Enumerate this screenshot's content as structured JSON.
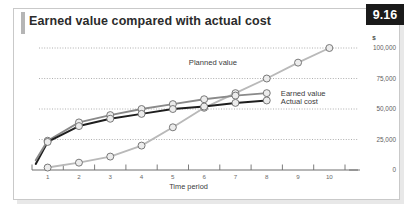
{
  "figure": {
    "badge": "9.16",
    "title": "Earned value compared with actual cost"
  },
  "chart_data": {
    "type": "line",
    "title": "Earned value compared with actual cost",
    "xlabel": "Time period",
    "ylabel": "$",
    "x": [
      1,
      2,
      3,
      4,
      5,
      6,
      7,
      8,
      9,
      10
    ],
    "xticklabels": [
      "1",
      "2",
      "3",
      "4",
      "5",
      "6",
      "7",
      "8",
      "9",
      "10"
    ],
    "yticks": [
      0,
      25000,
      50000,
      75000,
      100000
    ],
    "yticklabels": [
      "0",
      "25,000",
      "50,000",
      "75,000",
      "100,000"
    ],
    "ylim": [
      0,
      100000
    ],
    "xlim": [
      0.5,
      10.5
    ],
    "grid": true,
    "grid_style": "dotted-horizontal",
    "legend_position": "inline-annotations",
    "series": [
      {
        "name": "Planned value",
        "color": "#b9b9b9",
        "x": [
          1,
          2,
          3,
          4,
          5,
          6,
          7,
          8,
          9,
          10
        ],
        "values": [
          2000,
          6000,
          11000,
          20000,
          35000,
          51000,
          63000,
          75000,
          88000,
          100000
        ],
        "label": "Planned value"
      },
      {
        "name": "Earned value",
        "color": "#8a8a8a",
        "x": [
          1,
          2,
          3,
          4,
          5,
          6,
          7,
          8
        ],
        "values": [
          24000,
          39000,
          45000,
          50000,
          54000,
          58000,
          61000,
          63000
        ],
        "label": "Earned value"
      },
      {
        "name": "Actual cost",
        "color": "#1e1e1e",
        "x": [
          1,
          2,
          3,
          4,
          5,
          6,
          7,
          8
        ],
        "values": [
          23000,
          36000,
          42000,
          46000,
          50000,
          52000,
          55000,
          57000
        ],
        "label": "Actual cost"
      }
    ],
    "annotations": [
      {
        "text": "Planned value",
        "x": 7.05,
        "y": 88000
      },
      {
        "text": "Earned value",
        "x": 8.45,
        "y": 63000
      },
      {
        "text": "Actual cost",
        "x": 8.45,
        "y": 56000
      }
    ]
  },
  "colors": {
    "badge_bg": "#1a1a1a",
    "badge_text": "#ffffff",
    "frame_border": "#c9c9c9",
    "title_accent": "#b5b5b5",
    "axis": "#6e6e6e",
    "gridline": "#9a9a9a",
    "marker_fill": "#ececec",
    "marker_stroke": "#6b6b6b"
  }
}
